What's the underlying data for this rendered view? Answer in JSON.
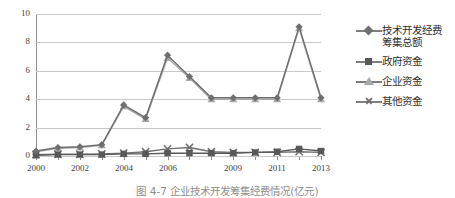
{
  "chart_data": {
    "type": "line",
    "title": "",
    "caption": "图 4-7  企业技术开发筹集经费情况(亿元)",
    "xlabel": "",
    "ylabel": "",
    "ylim": [
      0,
      10
    ],
    "yticks": [
      0,
      2,
      4,
      6,
      8,
      10
    ],
    "grid": true,
    "legend_position": "right",
    "x": [
      2000,
      2001,
      2002,
      2003,
      2004,
      2005,
      2006,
      2007,
      2008,
      2009,
      2010,
      2011,
      2012,
      2013
    ],
    "xtick_labels": [
      "2000",
      "",
      "2002",
      "",
      "2004",
      "",
      "2006",
      "",
      "",
      "2009",
      "",
      "2011",
      "",
      "2013"
    ],
    "visible_xlabels": [
      "2000",
      "2002",
      "2004",
      "2006",
      "2009",
      "2011",
      "2013"
    ],
    "series": [
      {
        "name": "技术开发经费筹集总额",
        "marker": "diamond",
        "color": "#6e6e6e",
        "values": [
          0.35,
          0.6,
          0.65,
          0.8,
          3.6,
          2.7,
          7.1,
          5.6,
          4.1,
          4.1,
          4.1,
          4.1,
          9.1,
          4.1
        ]
      },
      {
        "name": "政府资金",
        "marker": "square",
        "color": "#585858",
        "values": [
          0.05,
          0.1,
          0.1,
          0.1,
          0.15,
          0.15,
          0.2,
          0.2,
          0.2,
          0.2,
          0.25,
          0.3,
          0.5,
          0.35
        ]
      },
      {
        "name": "企业资金",
        "marker": "triangle",
        "color": "#a8a8a8",
        "values": [
          0.3,
          0.55,
          0.6,
          0.75,
          3.5,
          2.6,
          6.9,
          5.5,
          4.0,
          4.0,
          4.0,
          4.0,
          9.0,
          4.0
        ]
      },
      {
        "name": "其他资金",
        "marker": "cross",
        "color": "#707070",
        "values": [
          0.1,
          0.12,
          0.12,
          0.15,
          0.2,
          0.3,
          0.5,
          0.6,
          0.3,
          0.25,
          0.25,
          0.25,
          0.3,
          0.25
        ]
      }
    ]
  },
  "legend": {
    "items": [
      {
        "label": "技术开发经费\n筹集总额",
        "line1": "技术开发经费",
        "line2": "筹集总额"
      },
      {
        "label": "政府资金",
        "line1": "政府资金",
        "line2": ""
      },
      {
        "label": "企业资金",
        "line1": "企业资金",
        "line2": ""
      },
      {
        "label": "其他资金",
        "line1": "其他资金",
        "line2": ""
      }
    ]
  }
}
